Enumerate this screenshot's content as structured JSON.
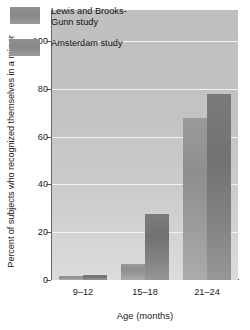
{
  "chart_data": {
    "type": "bar",
    "title": "",
    "xlabel": "Age (months)",
    "ylabel": "Percent of subjects who recognized themselves in a mirror",
    "categories": [
      "9–12",
      "15–18",
      "21–24"
    ],
    "series": [
      {
        "name": "Lewis and Brooks-\nGunn study",
        "values": [
          1.5,
          6.5,
          68
        ]
      },
      {
        "name": "Amsterdam study",
        "values": [
          2,
          27.5,
          78
        ]
      }
    ],
    "ylim": [
      0,
      113
    ],
    "yticks": [
      0,
      20,
      40,
      60,
      80,
      100
    ],
    "ytick_labels": [
      "0",
      "20",
      "40",
      "60",
      "80",
      "100"
    ],
    "grid": true,
    "legend_position": "upper-left-inside",
    "colors": {
      "plot_background": "#c6c6c6",
      "gridline": "#f2f2f2",
      "series_0": "#949494",
      "series_1": "#7b7b7b",
      "axis": "#555555",
      "text": "#1a1a1a"
    }
  }
}
